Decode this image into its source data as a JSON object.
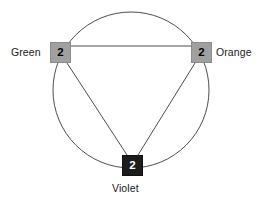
{
  "diagram": {
    "type": "circle-triangle-node-diagram",
    "background_color": "#ffffff",
    "stroke_color": "#4d4d4d",
    "circle": {
      "center_x": 131,
      "center_y": 90,
      "radius": 78,
      "stroke_width": 1
    },
    "nodes": [
      {
        "id": "green",
        "label": "Green",
        "value": "2",
        "box_fill": "#a0a0a0",
        "box_text_color": "#000000",
        "x": 50,
        "y": 42,
        "width": 21,
        "height": 21,
        "label_position": "left"
      },
      {
        "id": "orange",
        "label": "Orange",
        "value": "2",
        "box_fill": "#a0a0a0",
        "box_text_color": "#000000",
        "x": 191,
        "y": 42,
        "width": 21,
        "height": 21,
        "label_position": "right"
      },
      {
        "id": "violet",
        "label": "Violet",
        "value": "2",
        "box_fill": "#1c1c1c",
        "box_text_color": "#ffffff",
        "x": 122,
        "y": 155,
        "width": 21,
        "height": 21,
        "label_position": "below"
      }
    ],
    "edges": [
      {
        "from": "green",
        "to": "orange",
        "shape": "straight"
      },
      {
        "from": "green",
        "to": "violet",
        "shape": "straight"
      },
      {
        "from": "orange",
        "to": "violet",
        "shape": "straight"
      }
    ]
  }
}
